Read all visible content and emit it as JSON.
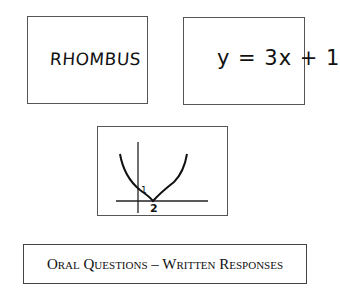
{
  "cards": [
    {
      "text": "RHOMBUS"
    },
    {
      "text": "y = 3x + 1"
    },
    {
      "graph": {
        "y_intercept_label": "1",
        "x_vertex_label": "2",
        "type": "parabola"
      }
    }
  ],
  "banner": {
    "text": "Oral Questions – Written Responses"
  }
}
